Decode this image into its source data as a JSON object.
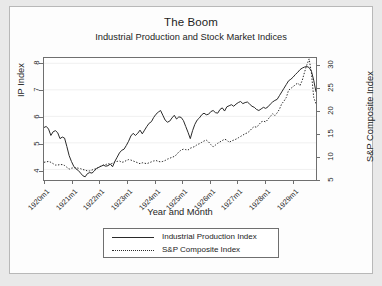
{
  "chart_data": {
    "type": "line",
    "title": "The Boom",
    "subtitle": "Industrial Production and Stock Market Indices",
    "xlabel": "Year and Month",
    "ylabel": "IP Index",
    "ylabel_right": "S&P Composite Index",
    "grid": true,
    "legend_position": "bottom",
    "xlim": [
      "1920m1",
      "1929m12"
    ],
    "ylim": [
      3.6,
      8.2
    ],
    "ylim_right": [
      4.6,
      31.5
    ],
    "xticks": [
      "1920m1",
      "1921m1",
      "1922m1",
      "1923m1",
      "1924m1",
      "1925m1",
      "1926m1",
      "1927m1",
      "1928m1",
      "1929m1"
    ],
    "yticks_left": [
      4,
      5,
      6,
      7,
      8
    ],
    "yticks_right": [
      5,
      10,
      15,
      20,
      25,
      30
    ],
    "series": [
      {
        "name": "Industrial Production Index",
        "axis": "left",
        "style": "solid",
        "color": "#2a2a2a",
        "x": [
          "1920m1",
          "1920m2",
          "1920m3",
          "1920m4",
          "1920m5",
          "1920m6",
          "1920m7",
          "1920m8",
          "1920m9",
          "1920m10",
          "1920m11",
          "1920m12",
          "1921m1",
          "1921m2",
          "1921m3",
          "1921m4",
          "1921m5",
          "1921m6",
          "1921m7",
          "1921m8",
          "1921m9",
          "1921m10",
          "1921m11",
          "1921m12",
          "1922m1",
          "1922m2",
          "1922m3",
          "1922m4",
          "1922m5",
          "1922m6",
          "1922m7",
          "1922m8",
          "1922m9",
          "1922m10",
          "1922m11",
          "1922m12",
          "1923m1",
          "1923m2",
          "1923m3",
          "1923m4",
          "1923m5",
          "1923m6",
          "1923m7",
          "1923m8",
          "1923m9",
          "1923m10",
          "1923m11",
          "1923m12",
          "1924m1",
          "1924m2",
          "1924m3",
          "1924m4",
          "1924m5",
          "1924m6",
          "1924m7",
          "1924m8",
          "1924m9",
          "1924m10",
          "1924m11",
          "1924m12",
          "1925m1",
          "1925m2",
          "1925m3",
          "1925m4",
          "1925m5",
          "1925m6",
          "1925m7",
          "1925m8",
          "1925m9",
          "1925m10",
          "1925m11",
          "1925m12",
          "1926m1",
          "1926m2",
          "1926m3",
          "1926m4",
          "1926m5",
          "1926m6",
          "1926m7",
          "1926m8",
          "1926m9",
          "1926m10",
          "1926m11",
          "1926m12",
          "1927m1",
          "1927m2",
          "1927m3",
          "1927m4",
          "1927m5",
          "1927m6",
          "1927m7",
          "1927m8",
          "1927m9",
          "1927m10",
          "1927m11",
          "1927m12",
          "1928m1",
          "1928m2",
          "1928m3",
          "1928m4",
          "1928m5",
          "1928m6",
          "1928m7",
          "1928m8",
          "1928m9",
          "1928m10",
          "1928m11",
          "1928m12",
          "1929m1",
          "1929m2",
          "1929m3",
          "1929m4",
          "1929m5",
          "1929m6",
          "1929m7",
          "1929m8",
          "1929m9",
          "1929m10",
          "1929m11",
          "1929m12"
        ],
        "values": [
          5.58,
          5.62,
          5.52,
          5.28,
          5.42,
          5.46,
          5.38,
          5.16,
          5.22,
          5.18,
          4.86,
          4.52,
          4.3,
          4.12,
          4.02,
          3.96,
          3.86,
          3.76,
          3.72,
          3.84,
          3.88,
          3.86,
          3.94,
          4.04,
          4.08,
          4.12,
          4.16,
          4.12,
          4.14,
          4.2,
          4.1,
          4.3,
          4.46,
          4.62,
          4.72,
          4.76,
          4.9,
          5.06,
          5.26,
          5.36,
          5.28,
          5.36,
          5.48,
          5.34,
          5.48,
          5.62,
          5.74,
          5.8,
          5.96,
          6.08,
          6.16,
          6.22,
          6.04,
          5.86,
          5.78,
          5.82,
          5.94,
          6.04,
          5.9,
          5.98,
          5.96,
          5.84,
          5.62,
          5.4,
          5.16,
          5.46,
          5.7,
          5.86,
          5.94,
          6.06,
          6.12,
          6.06,
          6.08,
          6.18,
          6.22,
          6.14,
          6.12,
          6.26,
          6.32,
          6.2,
          6.36,
          6.4,
          6.44,
          6.38,
          6.46,
          6.52,
          6.56,
          6.48,
          6.52,
          6.54,
          6.46,
          6.38,
          6.34,
          6.26,
          6.22,
          6.28,
          6.34,
          6.3,
          6.36,
          6.46,
          6.54,
          6.6,
          6.64,
          6.78,
          6.92,
          7.06,
          7.2,
          7.34,
          7.4,
          7.48,
          7.58,
          7.66,
          7.76,
          7.82,
          7.86,
          7.88,
          7.84,
          7.7,
          7.36,
          6.92
        ]
      },
      {
        "name": "S&P Composite Index",
        "axis": "right",
        "style": "dotted",
        "color": "#2a2a2a",
        "x": [
          "1920m1",
          "1920m2",
          "1920m3",
          "1920m4",
          "1920m5",
          "1920m6",
          "1920m7",
          "1920m8",
          "1920m9",
          "1920m10",
          "1920m11",
          "1920m12",
          "1921m1",
          "1921m2",
          "1921m3",
          "1921m4",
          "1921m5",
          "1921m6",
          "1921m7",
          "1921m8",
          "1921m9",
          "1921m10",
          "1921m11",
          "1921m12",
          "1922m1",
          "1922m2",
          "1922m3",
          "1922m4",
          "1922m5",
          "1922m6",
          "1922m7",
          "1922m8",
          "1922m9",
          "1922m10",
          "1922m11",
          "1922m12",
          "1923m1",
          "1923m2",
          "1923m3",
          "1923m4",
          "1923m5",
          "1923m6",
          "1923m7",
          "1923m8",
          "1923m9",
          "1923m10",
          "1923m11",
          "1923m12",
          "1924m1",
          "1924m2",
          "1924m3",
          "1924m4",
          "1924m5",
          "1924m6",
          "1924m7",
          "1924m8",
          "1924m9",
          "1924m10",
          "1924m11",
          "1924m12",
          "1925m1",
          "1925m2",
          "1925m3",
          "1925m4",
          "1925m5",
          "1925m6",
          "1925m7",
          "1925m8",
          "1925m9",
          "1925m10",
          "1925m11",
          "1925m12",
          "1926m1",
          "1926m2",
          "1926m3",
          "1926m4",
          "1926m5",
          "1926m6",
          "1926m7",
          "1926m8",
          "1926m9",
          "1926m10",
          "1926m11",
          "1926m12",
          "1927m1",
          "1927m2",
          "1927m3",
          "1927m4",
          "1927m5",
          "1927m6",
          "1927m7",
          "1927m8",
          "1927m9",
          "1927m10",
          "1927m11",
          "1927m12",
          "1928m1",
          "1928m2",
          "1928m3",
          "1928m4",
          "1928m5",
          "1928m6",
          "1928m7",
          "1928m8",
          "1928m9",
          "1928m10",
          "1928m11",
          "1928m12",
          "1929m1",
          "1929m2",
          "1929m3",
          "1929m4",
          "1929m5",
          "1929m6",
          "1929m7",
          "1929m8",
          "1929m9",
          "1929m10",
          "1929m11",
          "1929m12"
        ],
        "values": [
          8.5,
          8.6,
          8.7,
          8.5,
          8.2,
          7.9,
          7.9,
          8.0,
          8.0,
          7.8,
          7.4,
          7.0,
          7.2,
          7.3,
          7.3,
          7.2,
          7.1,
          6.9,
          6.8,
          6.6,
          6.6,
          6.8,
          7.0,
          7.1,
          7.4,
          7.7,
          7.9,
          8.0,
          8.2,
          8.1,
          8.3,
          8.6,
          8.7,
          8.8,
          8.5,
          8.6,
          8.9,
          9.1,
          9.0,
          8.8,
          8.6,
          8.4,
          8.2,
          8.4,
          8.3,
          8.2,
          8.4,
          8.6,
          8.8,
          8.9,
          8.7,
          8.6,
          8.7,
          8.9,
          9.2,
          9.4,
          9.6,
          9.8,
          10.2,
          10.8,
          11.2,
          11.4,
          11.3,
          11.2,
          11.6,
          11.8,
          12.0,
          12.4,
          12.6,
          12.9,
          13.2,
          13.4,
          13.0,
          12.4,
          11.9,
          12.3,
          12.7,
          13.0,
          13.3,
          13.6,
          13.4,
          12.9,
          13.2,
          13.4,
          13.6,
          13.9,
          14.2,
          14.5,
          14.8,
          15.0,
          15.4,
          16.0,
          16.4,
          16.2,
          16.8,
          17.4,
          17.6,
          17.4,
          18.0,
          18.6,
          19.2,
          18.8,
          19.4,
          20.2,
          21.4,
          22.0,
          22.8,
          24.4,
          24.8,
          25.2,
          25.6,
          26.0,
          25.4,
          26.6,
          28.4,
          30.0,
          31.3,
          28.2,
          22.8,
          21.4
        ]
      }
    ]
  },
  "legend": {
    "entries": [
      {
        "label": "Industrial Production Index",
        "style": "solid"
      },
      {
        "label": "S&P Composite Index",
        "style": "dotted"
      }
    ]
  }
}
